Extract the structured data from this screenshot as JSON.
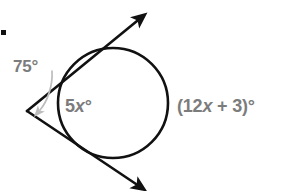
{
  "figure": {
    "bullet": {
      "name": "item-bullet",
      "shape": "square",
      "color": "#111111"
    },
    "colors": {
      "stroke_dark": "#111111",
      "label_gray": "#7c7c7c",
      "leader_gray": "#b9b9b9",
      "background": "#ffffff"
    },
    "labels": {
      "exterior_angle": {
        "text": "75°",
        "value": "75",
        "unit": "°",
        "color": "#7c7c7c"
      },
      "near_arc": {
        "prefix": "5",
        "variable": "x",
        "suffix": "°",
        "text": "5x°",
        "color": "#7c7c7c"
      },
      "far_arc": {
        "prefix": "(12",
        "variable": "x",
        "suffix": " + 3)°",
        "text": "(12x + 3)°",
        "color": "#7c7c7c"
      }
    },
    "geometry": {
      "circle": {
        "center_x": 113,
        "center_y": 103,
        "radius": 55,
        "stroke_width": 2.6
      },
      "vertex": {
        "x": 27,
        "y": 111
      },
      "upper_ray": {
        "from_x": 27,
        "from_y": 111,
        "to_x": 142,
        "to_y": 16,
        "arrowhead": "solid",
        "tangent_point_x": 95,
        "tangent_point_y": 52
      },
      "lower_ray": {
        "from_x": 27,
        "from_y": 111,
        "to_x": 141,
        "to_y": 189,
        "arrowhead": "solid",
        "tangent_point_x": 92,
        "tangent_point_y": 156
      },
      "leader": {
        "from_x": 50,
        "from_y": 72,
        "to_x": 34,
        "to_y": 114,
        "arrowhead": "solid",
        "color": "#b9b9b9"
      }
    }
  }
}
